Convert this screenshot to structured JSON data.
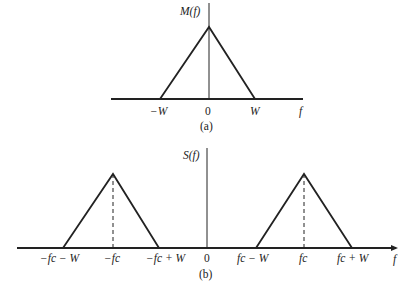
{
  "panel_a": {
    "y_label": "M(f)",
    "ticks": [
      "−W",
      "0",
      "W"
    ],
    "x_label": "f",
    "caption": "(a)"
  },
  "panel_b": {
    "y_label": "S(f)",
    "ticks": [
      "−fc − W",
      "−fc",
      "−fc + W",
      "0",
      "fc − W",
      "fc",
      "fc + W"
    ],
    "x_label": "f",
    "caption": "(b)"
  },
  "colors": {
    "stroke": "#222222",
    "background": "#ffffff"
  }
}
